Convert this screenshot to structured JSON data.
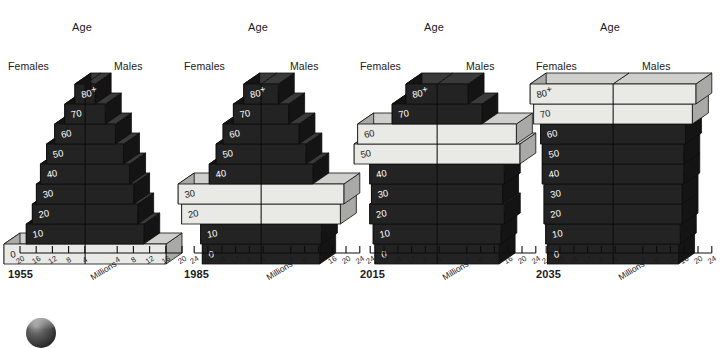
{
  "figure": {
    "background": "#ffffff",
    "axis_unit_label": "Millions",
    "age_header": "Age",
    "females_label": "Females",
    "males_label": "Males",
    "colors": {
      "dark_front": "#232323",
      "dark_top": "#3a3a3a",
      "dark_side": "#141414",
      "light_front": "#e9e9e6",
      "light_top": "#cfcfcb",
      "light_side": "#a9a9a5",
      "outline": "#0d0d0d",
      "text": "#1b1b1b"
    }
  },
  "age_groups": [
    "0",
    "10",
    "20",
    "30",
    "40",
    "50",
    "60",
    "70",
    "80+"
  ],
  "chart_data": {
    "type": "bar",
    "title": "",
    "xlabel": "Millions",
    "ylabel": "Age",
    "grid": false,
    "legend": "none",
    "orientation": "horizontal-population-pyramid-3d",
    "note": "Four isometric 3D population pyramids tracking the baby-boom cohort; highlighted (light) bars mark the cohort in each year.",
    "panels": [
      {
        "year": "1955",
        "axis_ticks_left": [
          "20",
          "16",
          "12",
          "8",
          "4"
        ],
        "axis_ticks_right": [
          "4",
          "8",
          "12",
          "16",
          "20"
        ],
        "axis_max": 20,
        "categories": [
          "0",
          "10",
          "20",
          "30",
          "40",
          "50",
          "60",
          "70",
          "80+"
        ],
        "series": [
          {
            "name": "Females",
            "values": [
              20.0,
              14.5,
              13.0,
              12.0,
              11.0,
              9.5,
              7.5,
              5.0,
              2.5
            ]
          },
          {
            "name": "Males",
            "values": [
              20.0,
              14.5,
              13.0,
              12.0,
              11.0,
              9.5,
              7.5,
              5.0,
              2.5
            ]
          }
        ],
        "highlighted_age_groups": [
          "0"
        ]
      },
      {
        "year": "1985",
        "axis_ticks_left": [
          "24",
          "20",
          "16",
          "12",
          "8",
          "4"
        ],
        "axis_ticks_right": [
          "4",
          "8",
          "12",
          "16",
          "20",
          "24"
        ],
        "axis_max": 24,
        "categories": [
          "0",
          "10",
          "20",
          "30",
          "40",
          "50",
          "60",
          "70",
          "80+"
        ],
        "series": [
          {
            "name": "Females",
            "values": [
              17.0,
              17.5,
              23.0,
              24.0,
              15.0,
              13.0,
              11.0,
              8.0,
              5.0
            ]
          },
          {
            "name": "Males",
            "values": [
              17.0,
              17.5,
              23.0,
              24.0,
              15.0,
              13.0,
              11.0,
              8.0,
              5.0
            ]
          }
        ],
        "highlighted_age_groups": [
          "20",
          "30"
        ]
      },
      {
        "year": "2015",
        "axis_ticks_left": [
          "24",
          "20",
          "16",
          "12",
          "8",
          "4"
        ],
        "axis_ticks_right": [
          "4",
          "8",
          "12",
          "16",
          "20",
          "24"
        ],
        "axis_max": 24,
        "categories": [
          "0",
          "10",
          "20",
          "30",
          "40",
          "50",
          "60",
          "70",
          "80+"
        ],
        "series": [
          {
            "name": "Females",
            "values": [
              18.0,
              18.5,
              19.5,
              19.0,
              19.5,
              24.0,
              23.0,
              13.0,
              9.0
            ]
          },
          {
            "name": "Males",
            "values": [
              18.0,
              18.5,
              19.5,
              19.0,
              19.5,
              24.0,
              23.0,
              13.0,
              9.0
            ]
          }
        ],
        "highlighted_age_groups": [
          "50",
          "60"
        ]
      },
      {
        "year": "2035",
        "axis_ticks_left": [
          "24",
          "20",
          "16",
          "12",
          "8",
          "4"
        ],
        "axis_ticks_right": [
          "4",
          "8",
          "12",
          "16",
          "20",
          "24"
        ],
        "axis_max": 24,
        "categories": [
          "0",
          "10",
          "20",
          "30",
          "40",
          "50",
          "60",
          "70",
          "80+"
        ],
        "series": [
          {
            "name": "Females",
            "values": [
              19.0,
              19.5,
              20.0,
              20.0,
              20.5,
              20.5,
              21.0,
              23.0,
              24.0
            ]
          },
          {
            "name": "Males",
            "values": [
              19.0,
              19.5,
              20.0,
              20.0,
              20.5,
              20.5,
              21.0,
              23.0,
              24.0
            ]
          }
        ],
        "highlighted_age_groups": [
          "70",
          "80+"
        ]
      }
    ]
  }
}
